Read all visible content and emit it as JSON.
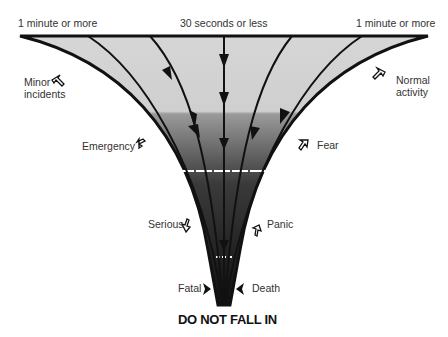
{
  "diagram": {
    "top_labels": {
      "left": "1 minute or more",
      "center": "30 seconds or less",
      "right": "1 minute or more"
    },
    "side_labels": {
      "left": [
        "Minor\nincidents",
        "Emergency",
        "Serious",
        "Fatal"
      ],
      "right": [
        "Normal\nactivity",
        "Fear",
        "Panic",
        "Death"
      ]
    },
    "stages_left": {
      "minor": "Minor",
      "incidents": "incidents",
      "emergency": "Emergency",
      "serious": "Serious",
      "fatal": "Fatal"
    },
    "stages_right": {
      "normal": "Normal",
      "activity": "activity",
      "fear": "Fear",
      "panic": "Panic",
      "death": "Death"
    },
    "footer": "DO NOT FALL IN",
    "colors": {
      "funnel_top": "#d8d8d8",
      "funnel_bottom": "#111111",
      "outline": "#111111"
    }
  }
}
